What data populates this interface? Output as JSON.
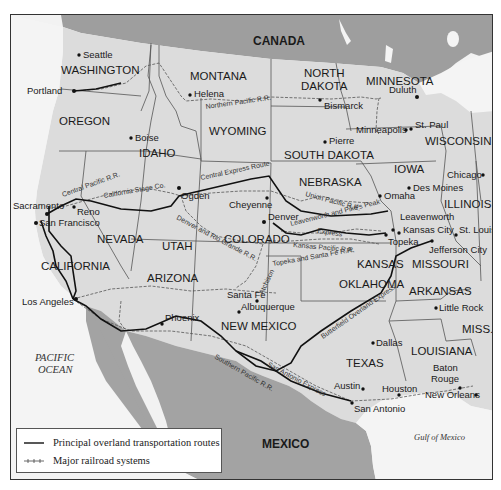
{
  "map": {
    "countries": {
      "north": "CANADA",
      "south": "MEXICO"
    },
    "waters": {
      "pacific_line1": "PACIFIC",
      "pacific_line2": "OCEAN",
      "gulf": "Gulf of Mexico"
    },
    "states": {
      "washington": "WASHINGTON",
      "oregon": "OREGON",
      "california": "CALIFORNIA",
      "idaho": "IDAHO",
      "nevada": "NEVADA",
      "montana": "MONTANA",
      "wyoming": "WYOMING",
      "utah": "UTAH",
      "arizona": "ARIZONA",
      "colorado": "COLORADO",
      "new_mexico": "NEW MEXICO",
      "north_dakota_1": "NORTH",
      "north_dakota_2": "DAKOTA",
      "south_dakota": "SOUTH DAKOTA",
      "nebraska": "NEBRASKA",
      "kansas": "KANSAS",
      "oklahoma": "OKLAHOMA",
      "texas": "TEXAS",
      "minnesota": "MINNESOTA",
      "iowa": "IOWA",
      "missouri": "MISSOURI",
      "arkansas": "ARKANSAS",
      "louisiana": "LOUISIANA",
      "wisconsin": "WISCONSIN",
      "illinois": "ILLINOIS",
      "mississippi": "MISS."
    },
    "cities": {
      "seattle": "Seattle",
      "portland": "Portland",
      "boise": "Boise",
      "helena": "Helena",
      "bismarck": "Bismarck",
      "duluth": "Duluth",
      "st_paul": "St. Paul",
      "minneapolis": "Minneapolis",
      "pierre": "Pierre",
      "chicago": "Chicago",
      "des_moines": "Des Moines",
      "omaha": "Omaha",
      "sacramento": "Sacramento",
      "reno": "Reno",
      "san_francisco": "San Francisco",
      "ogden": "Ogden",
      "cheyenne": "Cheyenne",
      "denver": "Denver",
      "leavenworth": "Leavenworth",
      "kansas_city": "Kansas City",
      "st_louis": "St. Louis",
      "topeka": "Topeka",
      "jefferson_city": "Jefferson City",
      "santa_fe": "Santa Fe",
      "albuquerque": "Albuquerque",
      "los_angeles": "Los Angeles",
      "phoenix": "Phoenix",
      "little_rock": "Little Rock",
      "dallas": "Dallas",
      "baton_rouge_1": "Baton",
      "baton_rouge_2": "Rouge",
      "austin": "Austin",
      "houston": "Houston",
      "san_antonio": "San Antonio",
      "new_orleans": "New Orleans"
    },
    "routes": {
      "northern_pacific": "Northern Pacific R.R.",
      "central_pacific": "Central Pacific R.R.",
      "california_stage": "California Stage Co.",
      "central_express": "Central Express Route",
      "union_pacific": "Union Pacific R.R.",
      "leavenworth_pikes_peak_1": "Leavenworth and Pike's Peak",
      "leavenworth_pikes_peak_2": "Express",
      "kansas_pacific": "Kansas Pacific R.R.",
      "topeka_santa_fe": "Topeka and Santa Fe R.R.",
      "denver_rio_grande": "Denver and Rio Grande R.R.",
      "atchison": "Atchison",
      "butterfield": "Butterfield Overland Express",
      "san_antonio_express": "San Antonio Express",
      "southern_pacific": "Southern Pacific R.R."
    },
    "colors": {
      "land": "#dcdcdc",
      "foreign_land": "#a3a3a3",
      "water": "#f4f4f4",
      "route": "#111111",
      "rail": "#555555"
    }
  },
  "legend": {
    "items": [
      {
        "label": "Principal overland transportation routes",
        "type": "solid-line"
      },
      {
        "label": "Major railroad systems",
        "type": "tick-line"
      }
    ]
  }
}
